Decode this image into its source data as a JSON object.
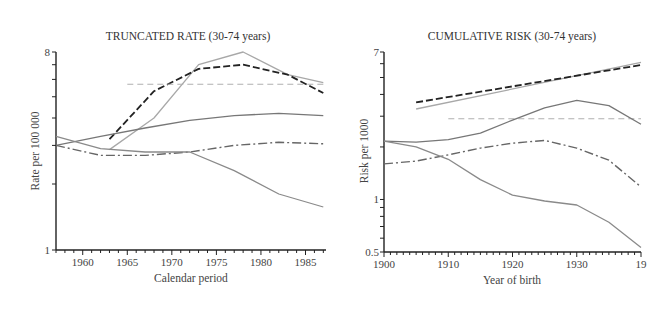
{
  "chart_data": [
    {
      "type": "line",
      "title": "TRUNCATED RATE (30-74 years)",
      "xlabel": "Calendar period",
      "ylabel": "Rate per 100 000",
      "yscale": "log",
      "xlim": [
        1957,
        1987.3
      ],
      "ylim": [
        1,
        8
      ],
      "xticks": [
        1960,
        1965,
        1970,
        1975,
        1980,
        1985
      ],
      "ytick_labels": [
        "1",
        "8"
      ],
      "grid": false,
      "series": [
        {
          "name": "light-solid-peak",
          "style": "solid",
          "color": "#a8a8a8",
          "x": [
            1963,
            1968,
            1973,
            1978,
            1983,
            1987
          ],
          "values": [
            2.87,
            4.0,
            7.0,
            8.0,
            6.3,
            5.8
          ]
        },
        {
          "name": "dark-dashed",
          "style": "dashed",
          "color": "#222222",
          "x": [
            1963,
            1968,
            1973,
            1978,
            1983,
            1987
          ],
          "values": [
            3.2,
            5.3,
            6.7,
            7.0,
            6.3,
            5.2
          ]
        },
        {
          "name": "light-dashed-flat",
          "style": "dashed-light",
          "color": "#b0b0b0",
          "x": [
            1965,
            1987
          ],
          "values": [
            5.7,
            5.7
          ]
        },
        {
          "name": "medium-solid-rising",
          "style": "solid",
          "color": "#777777",
          "x": [
            1957,
            1962,
            1967,
            1972,
            1977,
            1982,
            1987
          ],
          "values": [
            3.0,
            3.3,
            3.6,
            3.9,
            4.1,
            4.2,
            4.1
          ]
        },
        {
          "name": "dash-dot",
          "style": "dashdot",
          "color": "#666666",
          "x": [
            1957,
            1962,
            1967,
            1972,
            1977,
            1982,
            1987
          ],
          "values": [
            3.0,
            2.7,
            2.7,
            2.8,
            3.0,
            3.1,
            3.05
          ]
        },
        {
          "name": "solid-declining",
          "style": "solid",
          "color": "#8a8a8a",
          "x": [
            1957,
            1962,
            1967,
            1972,
            1977,
            1982,
            1987
          ],
          "values": [
            3.3,
            2.9,
            2.8,
            2.8,
            2.3,
            1.8,
            1.57
          ]
        }
      ]
    },
    {
      "type": "line",
      "title": "CUMULATIVE RISK (30-74 years)",
      "xlabel": "Year of birth",
      "ylabel": "Risk per 1000",
      "yscale": "log",
      "xlim": [
        1900,
        1940
      ],
      "ylim": [
        0.5,
        7
      ],
      "xticks": [
        1900,
        1910,
        1920,
        1930,
        1940
      ],
      "xtick_labels": [
        "1900",
        "1910",
        "1920",
        "1930",
        "19"
      ],
      "ytick_labels": [
        "0.5",
        "1",
        "7"
      ],
      "grid": false,
      "series": [
        {
          "name": "light-solid-upper",
          "style": "solid",
          "color": "#a8a8a8",
          "x": [
            1905,
            1940
          ],
          "values": [
            3.3,
            6.1
          ]
        },
        {
          "name": "dark-dashed",
          "style": "dashed",
          "color": "#222222",
          "x": [
            1905,
            1940
          ],
          "values": [
            3.6,
            5.9
          ]
        },
        {
          "name": "light-dashed-flat",
          "style": "dashed-light",
          "color": "#b0b0b0",
          "x": [
            1910,
            1940
          ],
          "values": [
            2.9,
            2.9
          ]
        },
        {
          "name": "medium-solid",
          "style": "solid",
          "color": "#777777",
          "x": [
            1900,
            1905,
            1910,
            1915,
            1920,
            1925,
            1930,
            1935,
            1940
          ],
          "values": [
            2.16,
            2.13,
            2.2,
            2.4,
            2.85,
            3.35,
            3.7,
            3.45,
            2.7
          ]
        },
        {
          "name": "dash-dot",
          "style": "dashdot",
          "color": "#666666",
          "x": [
            1900,
            1905,
            1910,
            1915,
            1920,
            1925,
            1930,
            1935,
            1940
          ],
          "values": [
            1.6,
            1.66,
            1.8,
            1.97,
            2.1,
            2.18,
            1.97,
            1.68,
            1.18
          ]
        },
        {
          "name": "solid-declining",
          "style": "solid",
          "color": "#8a8a8a",
          "x": [
            1900,
            1905,
            1910,
            1915,
            1920,
            1925,
            1930,
            1935,
            1940
          ],
          "values": [
            2.16,
            2.0,
            1.7,
            1.3,
            1.06,
            0.98,
            0.93,
            0.74,
            0.53
          ]
        }
      ]
    }
  ]
}
